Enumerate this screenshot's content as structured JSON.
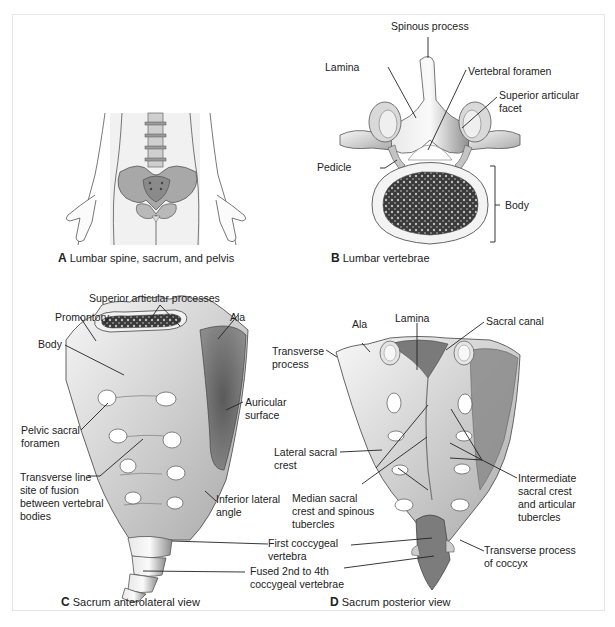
{
  "figure": {
    "panels": [
      {
        "id": "A",
        "caption_letter": "A",
        "caption_text": "Lumbar spine, sacrum, and pelvis",
        "labels": []
      },
      {
        "id": "B",
        "caption_letter": "B",
        "caption_text": "Lumbar vertebrae",
        "labels": [
          {
            "text": "Spinous process"
          },
          {
            "text": "Lamina"
          },
          {
            "text": "Vertebral foramen"
          },
          {
            "text": "Superior articular",
            "text2": "facet"
          },
          {
            "text": "Pedicle"
          },
          {
            "text": "Body"
          }
        ]
      },
      {
        "id": "C",
        "caption_letter": "C",
        "caption_text": "Sacrum anterolateral view",
        "labels": [
          {
            "text": "Superior articular processes"
          },
          {
            "text": "Promontory"
          },
          {
            "text": "Ala"
          },
          {
            "text": "Body"
          },
          {
            "text": "Auricular",
            "text2": "surface"
          },
          {
            "text": "Pelvic sacral",
            "text2": "foramen"
          },
          {
            "text": "Transverse line",
            "text2": "site of fusion",
            "text3": "between vertebral",
            "text4": "bodies"
          },
          {
            "text": "Inferior lateral",
            "text2": "angle"
          },
          {
            "text": "First coccygeal",
            "text2": "vertebra"
          },
          {
            "text": "Fused 2nd to 4th",
            "text2": "coccygeal vertebrae"
          }
        ]
      },
      {
        "id": "D",
        "caption_letter": "D",
        "caption_text": "Sacrum posterior view",
        "labels": [
          {
            "text": "Ala"
          },
          {
            "text": "Lamina"
          },
          {
            "text": "Sacral canal"
          },
          {
            "text": "Transverse",
            "text2": "process"
          },
          {
            "text": "Lateral sacral",
            "text2": "crest"
          },
          {
            "text": "Median sacral",
            "text2": "crest and spinous",
            "text3": "tubercles"
          },
          {
            "text": "Intermediate",
            "text2": "sacral crest",
            "text3": "and articular",
            "text4": "tubercles"
          },
          {
            "text": "Transverse process",
            "text2": "of coccyx"
          }
        ]
      }
    ],
    "colors": {
      "frame_border": "#e6e6e6",
      "bone_light": "#f2f2f2",
      "bone_mid": "#c8c8c8",
      "bone_dark": "#6a6a6a",
      "text": "#222222"
    }
  }
}
